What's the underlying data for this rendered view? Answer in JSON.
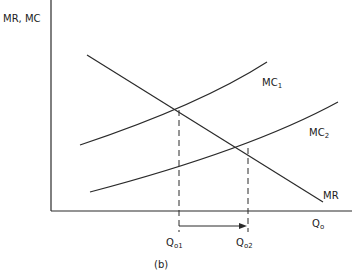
{
  "diagram": {
    "y_axis_label": "MR, MC",
    "x_axis_label": "Q",
    "x_axis_label_sub": "o",
    "caption": "(b)",
    "curves": [
      {
        "name": "MC",
        "sub": "1"
      },
      {
        "name": "MC",
        "sub": "2"
      },
      {
        "name": "MR",
        "sub": ""
      }
    ],
    "quantity_marks": [
      {
        "name": "Q",
        "sub": "o1"
      },
      {
        "name": "Q",
        "sub": "o2"
      }
    ],
    "line_color": "#2a2a2a"
  }
}
